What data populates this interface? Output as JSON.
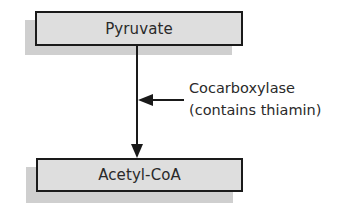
{
  "diagram": {
    "type": "metabolic-pathway",
    "nodes": [
      {
        "id": "pyruvate",
        "label": "Pyruvate"
      },
      {
        "id": "acetyl-coa",
        "label": "Acetyl-CoA"
      }
    ],
    "edges": [
      {
        "from": "pyruvate",
        "to": "acetyl-coa"
      }
    ],
    "enzyme": {
      "name": "Cocarboxylase",
      "note": "(contains thiamin)"
    },
    "colors": {
      "box_fill": "#dedede",
      "box_shadow": "#cfcfcf",
      "stroke": "#1a1a1a",
      "text": "#2a2a2a"
    }
  }
}
